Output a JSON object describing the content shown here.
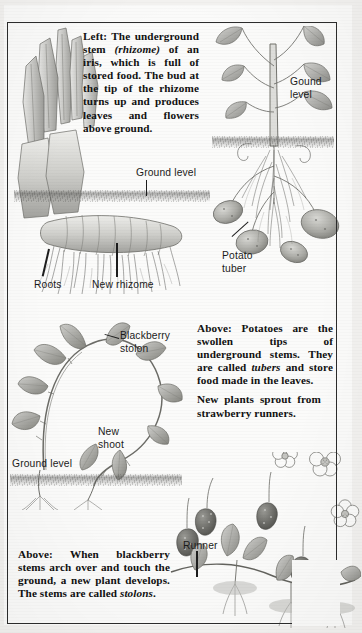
{
  "page": {
    "kind": "scanned-textbook-page",
    "topic": "Vegetative propagation: rhizomes, tubers, stolons and runners",
    "background_color": "#fbfbfa",
    "border_color": "#2c2c2c",
    "text_color": "#111111"
  },
  "captions": {
    "iris": {
      "lead": "Left:",
      "text": "The underground stem (rhizome) of an iris, which is full of stored food. The bud at the tip of the rhizome turns up and produces leaves and flowers above ground.",
      "italic_terms": [
        "rhizome"
      ]
    },
    "potato": {
      "lead": "Above:",
      "text": "Potatoes are the swollen tips of underground stems. They are called tubers and store food made in the leaves.",
      "italic_terms": [
        "tubers"
      ]
    },
    "strawberry": {
      "lead": "",
      "text": "New plants sprout from strawberry runners.",
      "italic_terms": []
    },
    "blackberry": {
      "lead": "Above:",
      "text": "When blackberry stems arch over and touch the ground, a new plant develops. The stems are called stolons.",
      "italic_terms": [
        "stolons"
      ]
    }
  },
  "labels": {
    "gound_level": "Gound\nlevel",
    "ground_level_top": "Ground level",
    "potato_tuber": "Potato\ntuber",
    "roots": "Roots",
    "new_rhizome": "New rhizome",
    "blackberry_stolon": "Blackberry\nstolon",
    "new_shoot": "New\nshoot",
    "ground_level_bottom": "Ground level",
    "runner": "Runner"
  },
  "illustrations": {
    "iris_rhizome": "iris-rhizome-drawing",
    "potato_plant": "potato-plant-drawing",
    "blackberry_stolon": "blackberry-stolon-drawing",
    "strawberry_runner": "strawberry-runner-drawing"
  }
}
